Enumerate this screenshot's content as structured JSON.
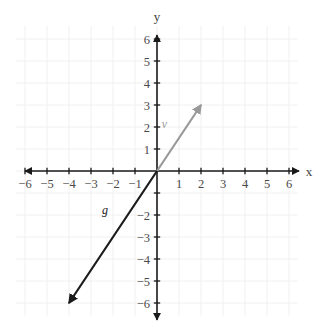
{
  "chart_data": {
    "type": "scatter",
    "title": "",
    "xlabel": "x",
    "ylabel": "y",
    "xlim": [
      -7,
      7
    ],
    "ylim": [
      -7,
      7
    ],
    "grid": true,
    "legend": "none",
    "x_ticks": [
      -6,
      -5,
      -4,
      -3,
      -2,
      -1,
      1,
      2,
      3,
      4,
      5,
      6
    ],
    "y_ticks": [
      -6,
      -5,
      -4,
      -3,
      -2,
      -1,
      1,
      2,
      3,
      4,
      5,
      6
    ],
    "x_tick_labels": [
      "−6",
      "−5",
      "−4",
      "−3",
      "−2",
      "−1",
      "1",
      "2",
      "3",
      "4",
      "5",
      "6"
    ],
    "y_tick_labels": [
      "−6",
      "−5",
      "−4",
      "−3",
      "−2",
      "−1",
      "1",
      "2",
      "3",
      "4",
      "5",
      "6"
    ],
    "hidden_y_tick_labels": [
      -1
    ],
    "vectors": [
      {
        "name": "v",
        "label": "v⃗",
        "tail": [
          0,
          0
        ],
        "head": [
          2,
          3
        ],
        "color": "#999999",
        "label_position": [
          0.55,
          1.95
        ]
      },
      {
        "name": "g",
        "label": "g⃗",
        "tail": [
          0,
          0
        ],
        "head": [
          -4,
          -6
        ],
        "color": "#1a1a1a",
        "label_position": [
          -2.15,
          -1.95
        ]
      }
    ],
    "annotations": []
  },
  "axes": {
    "x_axis_name": "x",
    "y_axis_name": "y",
    "axis_color": "#1a1a1a",
    "grid_color": "#f0f0f0",
    "origin_px": [
      157,
      171
    ],
    "unit_px": 22
  },
  "colors": {
    "background": "#ffffff",
    "grid": "#f0f0f0",
    "axis": "#1a1a1a",
    "vector_v": "#999999",
    "vector_g": "#1a1a1a",
    "tick_text": "#4a4a4a"
  }
}
